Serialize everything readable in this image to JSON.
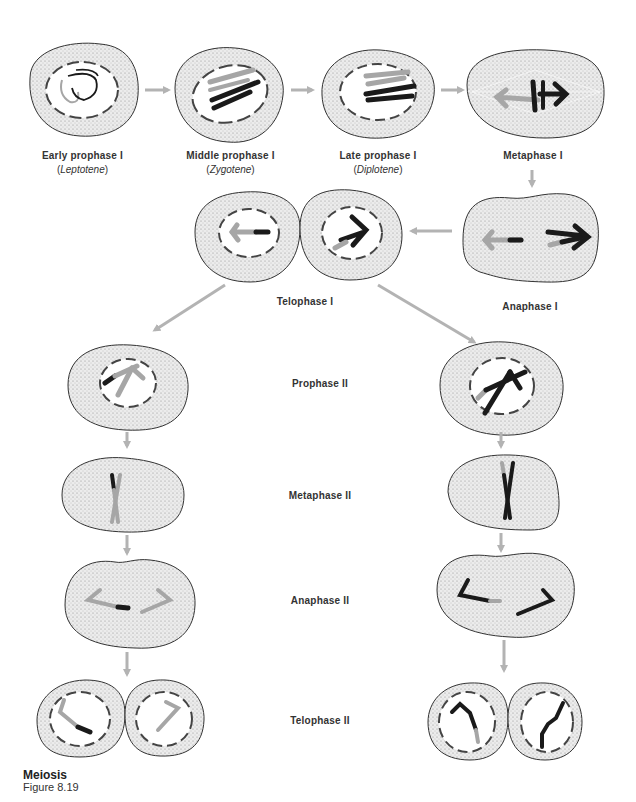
{
  "figure": {
    "title": "Meiosis",
    "subtitle": "Figure 8.19"
  },
  "colors": {
    "arrow": "#b3b3b3",
    "chromosome_dark": "#1a1a1a",
    "chromosome_light": "#a6a6a6",
    "cell_fill": "#e4e4e4",
    "cell_outline": "#333333"
  },
  "stages": {
    "early_prophase_1": {
      "label": "Early prophase I",
      "sub_open": "(",
      "sub": "Leptotene",
      "sub_close": ")"
    },
    "middle_prophase_1": {
      "label": "Middle prophase I",
      "sub_open": "(",
      "sub": "Zygotene",
      "sub_close": ")"
    },
    "late_prophase_1": {
      "label": "Late prophase I",
      "sub_open": "(",
      "sub": "Diplotene",
      "sub_close": ")"
    },
    "metaphase_1": {
      "label": "Metaphase I"
    },
    "anaphase_1": {
      "label": "Anaphase I"
    },
    "telophase_1": {
      "label": "Telophase I"
    },
    "prophase_2": {
      "label": "Prophase II"
    },
    "metaphase_2": {
      "label": "Metaphase II"
    },
    "anaphase_2": {
      "label": "Anaphase II"
    },
    "telophase_2": {
      "label": "Telophase II"
    }
  }
}
